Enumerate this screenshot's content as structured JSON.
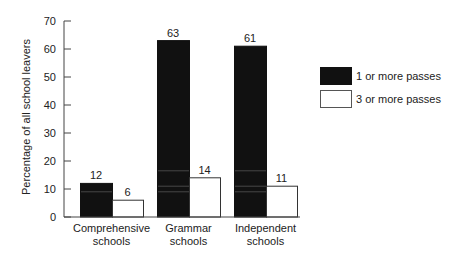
{
  "chart_data": {
    "type": "bar",
    "title": "",
    "xlabel": "",
    "ylabel": "Percentage of all school leavers",
    "ylim": [
      0,
      70
    ],
    "yticks": [
      0,
      10,
      20,
      30,
      40,
      50,
      60,
      70
    ],
    "grid": false,
    "legend_position": "right",
    "categories": [
      "Comprehensive schools",
      "Grammar schools",
      "Independent schools"
    ],
    "category_lines": [
      [
        "Comprehensive",
        "schools"
      ],
      [
        "Grammar",
        "schools"
      ],
      [
        "Independent",
        "schools"
      ]
    ],
    "series": [
      {
        "name": "1 or more passes",
        "color": "#111111",
        "values": [
          12,
          63,
          61
        ]
      },
      {
        "name": "3 or more passes",
        "color": "#ffffff",
        "values": [
          6,
          14,
          11
        ]
      }
    ]
  }
}
